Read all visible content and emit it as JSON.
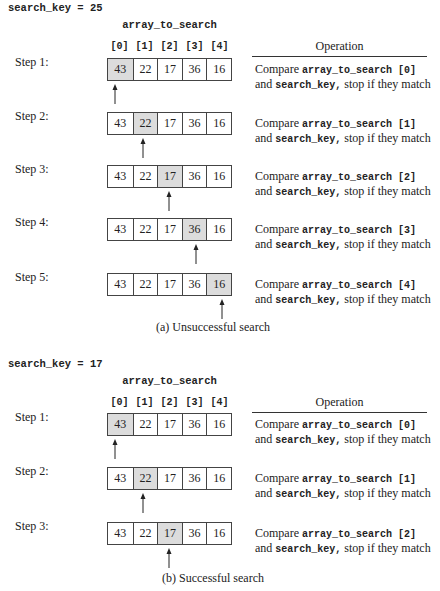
{
  "colors": {
    "highlight": "#dcdcdc",
    "border": "#444444",
    "text": "#222222"
  },
  "panels": [
    {
      "search_key_label": "search_key = 25",
      "array_name": "array_to_search",
      "indices": [
        "[0]",
        "[1]",
        "[2]",
        "[3]",
        "[4]"
      ],
      "operation_header": "Operation",
      "caption": "(a) Unsuccessful search",
      "steps": [
        {
          "label": "Step 1:",
          "values": [
            "43",
            "22",
            "17",
            "36",
            "16"
          ],
          "highlight": 0,
          "op": {
            "compare": "Compare ",
            "element": "array_to_search [0]",
            "and": "and ",
            "key": "search_key,",
            "rest": " stop if they match"
          }
        },
        {
          "label": "Step 2:",
          "values": [
            "43",
            "22",
            "17",
            "36",
            "16"
          ],
          "highlight": 1,
          "op": {
            "compare": "Compare ",
            "element": "array_to_search [1]",
            "and": "and ",
            "key": "search_key,",
            "rest": " stop if they match"
          }
        },
        {
          "label": "Step 3:",
          "values": [
            "43",
            "22",
            "17",
            "36",
            "16"
          ],
          "highlight": 2,
          "op": {
            "compare": "Compare ",
            "element": "array_to_search [2]",
            "and": "and ",
            "key": "search_key,",
            "rest": " stop if they match"
          }
        },
        {
          "label": "Step 4:",
          "values": [
            "43",
            "22",
            "17",
            "36",
            "16"
          ],
          "highlight": 3,
          "op": {
            "compare": "Compare ",
            "element": "array_to_search [3]",
            "and": "and ",
            "key": "search_key,",
            "rest": " stop if they match"
          }
        },
        {
          "label": "Step 5:",
          "values": [
            "43",
            "22",
            "17",
            "36",
            "16"
          ],
          "highlight": 4,
          "op": {
            "compare": "Compare ",
            "element": "array_to_search [4]",
            "and": "and ",
            "key": "search_key,",
            "rest": " stop if they match"
          }
        }
      ]
    },
    {
      "search_key_label": "search_key = 17",
      "array_name": "array_to_search",
      "indices": [
        "[0]",
        "[1]",
        "[2]",
        "[3]",
        "[4]"
      ],
      "operation_header": "Operation",
      "caption": "(b) Successful search",
      "steps": [
        {
          "label": "Step 1:",
          "values": [
            "43",
            "22",
            "17",
            "36",
            "16"
          ],
          "highlight": 0,
          "op": {
            "compare": "Compare ",
            "element": "array_to_search [0]",
            "and": "and ",
            "key": "search_key,",
            "rest": " stop if they match"
          }
        },
        {
          "label": "Step 2:",
          "values": [
            "43",
            "22",
            "17",
            "36",
            "16"
          ],
          "highlight": 1,
          "op": {
            "compare": "Compare ",
            "element": "array_to_search [1]",
            "and": "and ",
            "key": "search_key,",
            "rest": " stop if they match"
          }
        },
        {
          "label": "Step 3:",
          "values": [
            "43",
            "22",
            "17",
            "36",
            "16"
          ],
          "highlight": 2,
          "op": {
            "compare": "Compare ",
            "element": "array_to_search [2]",
            "and": "and ",
            "key": "search_key,",
            "rest": " stop if they match"
          }
        }
      ]
    }
  ]
}
